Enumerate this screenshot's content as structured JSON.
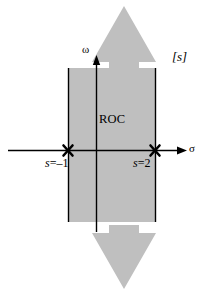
{
  "figure": {
    "kind": "s-plane-roc-diagram",
    "background_color": "#ffffff"
  },
  "plane_label": {
    "text": "[s]",
    "name": "s-plane"
  },
  "axes": {
    "vertical": {
      "label": "ω",
      "name": "imaginary-axis-omega",
      "color": "#000000"
    },
    "horizontal": {
      "label": "σ",
      "name": "real-axis-sigma",
      "color": "#000000"
    },
    "origin": {
      "x": 96,
      "y": 150
    }
  },
  "region": {
    "label": "ROC",
    "fill_color": "#bfbfbf",
    "edge_color": "#000000",
    "left_sigma": -1,
    "right_sigma": 2,
    "x_left_px": 68,
    "x_right_px": 155,
    "y_top_px": 68,
    "y_bottom_px": 222
  },
  "arrows": {
    "fill_color": "#bfbfbf",
    "up": {
      "name": "roc-extends-up-arrow"
    },
    "down": {
      "name": "roc-extends-down-arrow"
    }
  },
  "poles": [
    {
      "marker": "x",
      "sigma": -1,
      "label_prefix": "s",
      "label_equals": "=",
      "label_value": "–1",
      "label_full": "s = –1",
      "x_px": 68,
      "y_px": 150
    },
    {
      "marker": "x",
      "sigma": 2,
      "label_prefix": "s",
      "label_equals": "=",
      "label_value": "2",
      "label_full": "s = 2",
      "x_px": 155,
      "y_px": 150
    }
  ]
}
